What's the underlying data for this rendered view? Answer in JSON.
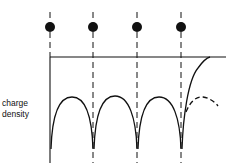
{
  "diagram": {
    "title": "",
    "y_axis_label_line1": "charge",
    "y_axis_label_line2": "density",
    "ion_positions_x": [
      50,
      93,
      137,
      181
    ],
    "ion_y": 27,
    "ion_radius": 5,
    "uniform_density_level_y": 57,
    "uniform_density_line_x_end": 226,
    "arc_peak_y": 97,
    "arc_trough_y": 147,
    "colors": {
      "ink": "#111111",
      "background": "#ffffff"
    },
    "elements": [
      {
        "kind": "ion",
        "count": 4,
        "shape": "filled-circle"
      },
      {
        "kind": "dashed-vertical-line",
        "count": 4,
        "through": "ion centers"
      },
      {
        "kind": "solid-horizontal-line",
        "meaning": "uniform charge density level"
      },
      {
        "kind": "periodic-cusped-arcs",
        "meaning": "charge density between ions",
        "count": 3
      },
      {
        "kind": "solid-curve",
        "meaning": "density rising to uniform level at surface"
      },
      {
        "kind": "dashed-curve",
        "meaning": "alternative density decay beyond surface"
      }
    ]
  }
}
